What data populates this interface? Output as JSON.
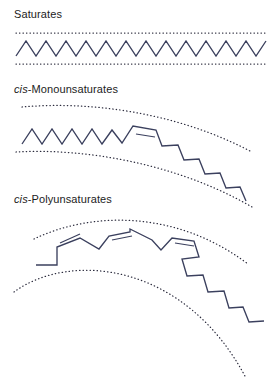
{
  "figure": {
    "background_color": "#ffffff",
    "chain_color": "#3b405e",
    "guide_color": "#2b2b3d",
    "label_color": "#1c1c1c",
    "width": 280,
    "height": 382
  },
  "panels": [
    {
      "id": "saturates",
      "label_italic_prefix": "",
      "label_text": "Saturates",
      "label_x": 14,
      "label_y": 18,
      "description": "Straight extended zig-zag hydrocarbon chain lying between two parallel straight dotted guide lines.",
      "double_bond_count": 0,
      "guides": [
        "M 16 33 L 266 33",
        "M 16 64 L 266 64"
      ],
      "chain": "M 16 56 L 26 41 L 36 56 L 46 41 L 56 56 L 66 41 L 76 56 L 86 41 L 96 56 L 106 41 L 116 56 L 126 41 L 136 56 L 146 41 L 156 56 L 166 41 L 176 56 L 186 41 L 196 56 L 206 41 L 216 56 L 226 41 L 236 56 L 246 41 L 256 56 L 266 41",
      "double_bonds": []
    },
    {
      "id": "cis-monounsaturates",
      "label_italic_prefix": "cis",
      "label_text": "-Monounsaturates",
      "label_x": 14,
      "label_y": 93,
      "description": "Chain with a single cis double bond producing one bend; the chain curves gently downward to the right between two curved dotted guide lines.",
      "double_bond_count": 1,
      "guides": [
        "M 22 107 C 90 101, 175 112, 250 151",
        "M 16 152 C 84 148, 176 163, 252 207"
      ],
      "chain": "M 22 144 L 32 129 L 42 144 L 52 129 L 62 144 L 72 129 L 82 144 L 92 129 L 102 144 L 112 130 L 122 143 L 133 126 L 156 130 L 162 146 L 178 145 L 184 160 L 199 159 L 205 174 L 220 173 L 226 188 L 240 187 L 246 201",
      "double_bonds": [
        {
          "x1": 136,
          "y1": 134,
          "x2": 155,
          "y2": 137
        }
      ]
    },
    {
      "id": "cis-polyunsaturates",
      "label_italic_prefix": "cis",
      "label_text": "-Polyunsaturates",
      "label_x": 14,
      "label_y": 203,
      "description": "Chain with three cis double bonds producing a pronounced hook; the chain arcs strongly downward between two widely curved dotted guide lines.",
      "double_bond_count": 3,
      "guides": [
        "M 34 239 C 90 212, 175 209, 248 264",
        "M 14 292 C 70 251, 185 262, 246 378"
      ],
      "chain": "M 36 265 L 57 265 L 57 247 L 80 238 L 99 249 L 109 236 L 130 232 L 130 229 L 152 240 L 161 250 L 172 238 L 194 241 L 199 257 L 182 259 L 187 276 L 203 275 L 208 292 L 224 291 L 229 308 L 243 307 L 249 322 L 264 321",
      "double_bonds": [
        {
          "x1": 60,
          "y1": 243,
          "x2": 80,
          "y2": 234
        },
        {
          "x1": 112,
          "y1": 240,
          "x2": 132,
          "y2": 236
        },
        {
          "x1": 175,
          "y1": 243,
          "x2": 194,
          "y2": 246
        }
      ]
    }
  ]
}
